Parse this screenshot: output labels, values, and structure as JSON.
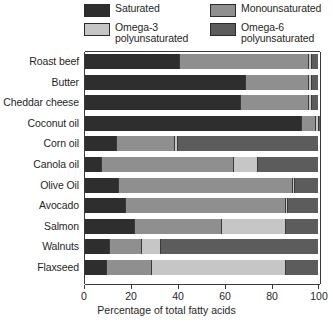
{
  "chart_data": {
    "type": "bar",
    "orientation": "horizontal",
    "stacked": true,
    "title": "",
    "xlabel": "Percentage of total fatty acids",
    "ylabel": "",
    "xlim": [
      0,
      100
    ],
    "xticks": [
      0,
      20,
      40,
      60,
      80,
      100
    ],
    "xticklabels": [
      "0",
      "20",
      "40",
      "60",
      "80",
      "100"
    ],
    "grid": false,
    "legend_position": "above-plot",
    "legend": [
      {
        "name": "Saturated",
        "key": "saturated",
        "color": "#2e2e2e"
      },
      {
        "name": "Monounsaturated",
        "key": "mono",
        "color": "#8f8f8f"
      },
      {
        "name": "Omega-3\npolyunsaturated",
        "key": "omega3",
        "color": "#c6c6c6"
      },
      {
        "name": "Omega-6\npolyunsaturated",
        "key": "omega6",
        "color": "#5c5c5c"
      }
    ],
    "categories": [
      "Roast beef",
      "Butter",
      "Cheddar cheese",
      "Coconut oil",
      "Corn oil",
      "Canola oil",
      "Olive Oil",
      "Avocado",
      "Salmon",
      "Walnuts",
      "Flaxseed"
    ],
    "series": [
      {
        "name": "Saturated",
        "values": [
          40,
          68,
          66,
          92,
          13,
          7,
          14,
          17,
          21,
          10,
          9
        ]
      },
      {
        "name": "Monounsaturated",
        "values": [
          55,
          27,
          29,
          6,
          25,
          56,
          74,
          68,
          37,
          14,
          19
        ]
      },
      {
        "name": "Omega-3 polyunsaturated",
        "values": [
          1,
          1,
          1,
          1,
          1,
          10,
          1,
          1,
          27,
          8,
          57
        ]
      },
      {
        "name": "Omega-6 polyunsaturated",
        "values": [
          3,
          3,
          3,
          1,
          60,
          26,
          10,
          13,
          14,
          67,
          14
        ]
      }
    ]
  },
  "axes": {
    "xtitle": "Percentage of total fatty acids"
  }
}
